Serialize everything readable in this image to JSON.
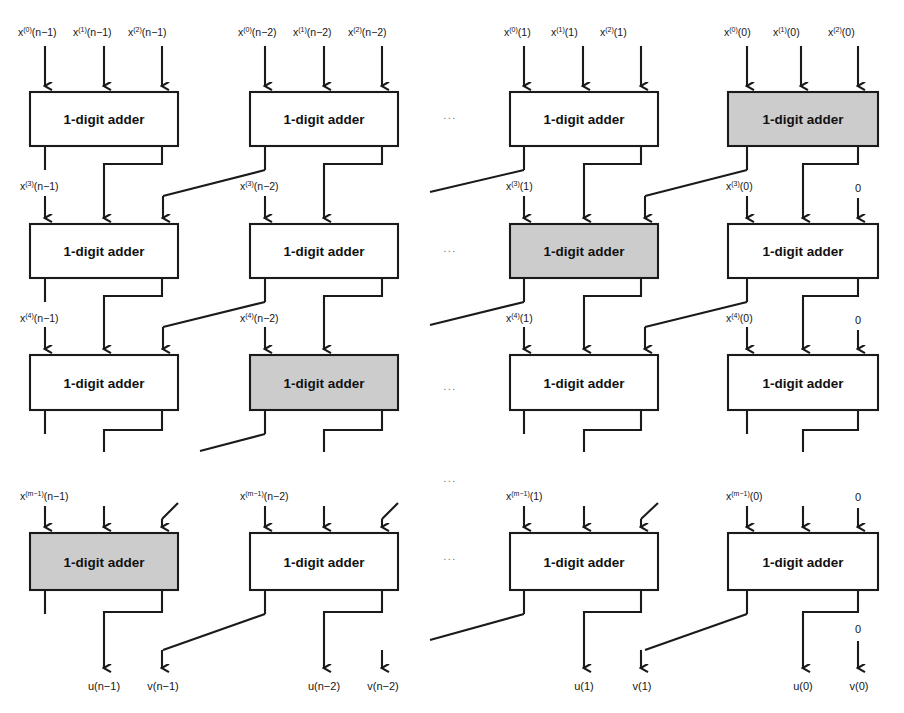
{
  "figure": {
    "kind": "block-diagram",
    "block_label": "1-digit adder",
    "colors": {
      "line": "#1a1a1a",
      "box_fill_plain": "#ffffff",
      "box_fill_shaded": "#cccccc",
      "text": "#161616",
      "ellipsis": "#777777"
    },
    "ellipsis_glyph": "...",
    "zero_label": "0"
  },
  "columns": [
    {
      "id": "col-n-1",
      "index_text": "(n−1)"
    },
    {
      "id": "col-n-2",
      "index_text": "(n−2)"
    },
    {
      "id": "col-1",
      "index_text": "(1)"
    },
    {
      "id": "col-0",
      "index_text": "(0)"
    }
  ],
  "rows": [
    {
      "id": "row-1",
      "y": 92,
      "height": 54
    },
    {
      "id": "row-2",
      "y": 224,
      "height": 54
    },
    {
      "id": "row-3",
      "y": 355,
      "height": 55
    },
    {
      "id": "row-4",
      "y": 533,
      "height": 57
    }
  ],
  "blocks": [
    {
      "id": "b-r1-c0",
      "row": 1,
      "col": 1,
      "label": "1-digit adder",
      "shaded": false
    },
    {
      "id": "b-r1-c1",
      "row": 1,
      "col": 2,
      "label": "1-digit adder",
      "shaded": false
    },
    {
      "id": "b-r1-c2",
      "row": 1,
      "col": 3,
      "label": "1-digit adder",
      "shaded": false
    },
    {
      "id": "b-r1-c3",
      "row": 1,
      "col": 4,
      "label": "1-digit adder",
      "shaded": true
    },
    {
      "id": "b-r2-c0",
      "row": 2,
      "col": 1,
      "label": "1-digit adder",
      "shaded": false
    },
    {
      "id": "b-r2-c1",
      "row": 2,
      "col": 2,
      "label": "1-digit adder",
      "shaded": false
    },
    {
      "id": "b-r2-c2",
      "row": 2,
      "col": 3,
      "label": "1-digit adder",
      "shaded": true
    },
    {
      "id": "b-r2-c3",
      "row": 2,
      "col": 4,
      "label": "1-digit adder",
      "shaded": false
    },
    {
      "id": "b-r3-c0",
      "row": 3,
      "col": 1,
      "label": "1-digit adder",
      "shaded": false
    },
    {
      "id": "b-r3-c1",
      "row": 3,
      "col": 2,
      "label": "1-digit adder",
      "shaded": true
    },
    {
      "id": "b-r3-c2",
      "row": 3,
      "col": 3,
      "label": "1-digit adder",
      "shaded": false
    },
    {
      "id": "b-r3-c3",
      "row": 3,
      "col": 4,
      "label": "1-digit adder",
      "shaded": false
    },
    {
      "id": "b-r4-c0",
      "row": 4,
      "col": 1,
      "label": "1-digit adder",
      "shaded": true
    },
    {
      "id": "b-r4-c1",
      "row": 4,
      "col": 2,
      "label": "1-digit adder",
      "shaded": false
    },
    {
      "id": "b-r4-c2",
      "row": 4,
      "col": 3,
      "label": "1-digit adder",
      "shaded": false
    },
    {
      "id": "b-r4-c3",
      "row": 4,
      "col": 4,
      "label": "1-digit adder",
      "shaded": false
    }
  ],
  "top_inputs": [
    {
      "col": 1,
      "labels": [
        {
          "base": "x",
          "sup": "(0)",
          "arg": "(n−1)"
        },
        {
          "base": "x",
          "sup": "(1)",
          "arg": "(n−1)"
        },
        {
          "base": "x",
          "sup": "(2)",
          "arg": "(n−1)"
        }
      ]
    },
    {
      "col": 2,
      "labels": [
        {
          "base": "x",
          "sup": "(0)",
          "arg": "(n−2)"
        },
        {
          "base": "x",
          "sup": "(1)",
          "arg": "(n−2)"
        },
        {
          "base": "x",
          "sup": "(2)",
          "arg": "(n−2)"
        }
      ]
    },
    {
      "col": 3,
      "labels": [
        {
          "base": "x",
          "sup": "(0)",
          "arg": "(1)"
        },
        {
          "base": "x",
          "sup": "(1)",
          "arg": "(1)"
        },
        {
          "base": "x",
          "sup": "(2)",
          "arg": "(1)"
        }
      ]
    },
    {
      "col": 4,
      "labels": [
        {
          "base": "x",
          "sup": "(0)",
          "arg": "(0)"
        },
        {
          "base": "x",
          "sup": "(1)",
          "arg": "(0)"
        },
        {
          "base": "x",
          "sup": "(2)",
          "arg": "(0)"
        }
      ]
    }
  ],
  "stage_labels": [
    {
      "row": 2,
      "col": 1,
      "base": "x",
      "sup": "(3)",
      "arg": "(n−1)"
    },
    {
      "row": 2,
      "col": 2,
      "base": "x",
      "sup": "(3)",
      "arg": "(n−2)"
    },
    {
      "row": 2,
      "col": 3,
      "base": "x",
      "sup": "(3)",
      "arg": "(1)"
    },
    {
      "row": 2,
      "col": 4,
      "base": "x",
      "sup": "(3)",
      "arg": "(0)"
    },
    {
      "row": 3,
      "col": 1,
      "base": "x",
      "sup": "(4)",
      "arg": "(n−1)"
    },
    {
      "row": 3,
      "col": 2,
      "base": "x",
      "sup": "(4)",
      "arg": "(n−2)"
    },
    {
      "row": 3,
      "col": 3,
      "base": "x",
      "sup": "(4)",
      "arg": "(1)"
    },
    {
      "row": 3,
      "col": 4,
      "base": "x",
      "sup": "(4)",
      "arg": "(0)"
    },
    {
      "row": 4,
      "col": 1,
      "base": "x",
      "sup": "(m−1)",
      "arg": "(n−1)"
    },
    {
      "row": 4,
      "col": 2,
      "base": "x",
      "sup": "(m−1)",
      "arg": "(n−2)"
    },
    {
      "row": 4,
      "col": 3,
      "base": "x",
      "sup": "(m−1)",
      "arg": "(1)"
    },
    {
      "row": 4,
      "col": 4,
      "base": "x",
      "sup": "(m−1)",
      "arg": "(0)"
    }
  ],
  "zero_labels": [
    {
      "id": "zero-r2-c3",
      "row": 2,
      "col": 4,
      "text": "0"
    },
    {
      "id": "zero-r3-c3",
      "row": 3,
      "col": 4,
      "text": "0"
    },
    {
      "id": "zero-r4-c3-in",
      "row": 4,
      "col": 4,
      "text": "0"
    },
    {
      "id": "zero-r4-c3-out",
      "row": 4,
      "col": 4,
      "text": "0"
    }
  ],
  "outputs": [
    {
      "col": 1,
      "u": "u(n−1)",
      "v": "v(n−1)"
    },
    {
      "col": 2,
      "u": "u(n−2)",
      "v": "v(n−2)"
    },
    {
      "col": 3,
      "u": "u(1)",
      "v": "v(1)"
    },
    {
      "col": 4,
      "u": "u(0)",
      "v": "v(0)"
    }
  ],
  "ellipses": [
    {
      "id": "ell-row1",
      "x": 450,
      "y": 119,
      "text": "..."
    },
    {
      "id": "ell-row2",
      "x": 450,
      "y": 252,
      "text": "..."
    },
    {
      "id": "ell-row3",
      "x": 450,
      "y": 390,
      "text": "..."
    },
    {
      "id": "ell-vertical-gap",
      "x": 450,
      "y": 482,
      "text": "..."
    },
    {
      "id": "ell-row4",
      "x": 450,
      "y": 560,
      "text": "..."
    }
  ]
}
